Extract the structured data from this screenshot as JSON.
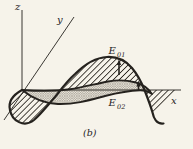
{
  "figure": {
    "caption": "(b)",
    "axis_labels": {
      "x": "x",
      "y": "y",
      "z": "z"
    },
    "labels": {
      "e01": {
        "base": "E",
        "sub": "01"
      },
      "e02": {
        "base": "E",
        "sub": "02"
      }
    },
    "colors": {
      "background": "#f6f3ea",
      "ink": "#25221e",
      "band_fill": "#eae7dd",
      "crosshatch_line": "#90897c"
    }
  }
}
